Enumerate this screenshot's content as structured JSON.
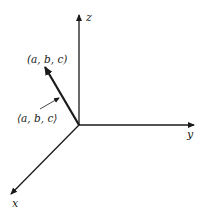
{
  "diagram": {
    "title": "",
    "axes": {
      "x": {
        "label": "x"
      },
      "y": {
        "label": "y"
      },
      "z": {
        "label": "z"
      }
    },
    "point_label": "(a, b, c)",
    "vector_label": "⟨a, b, c⟩",
    "colors": {
      "ink": "#1a1a1a",
      "background": "#ffffff"
    }
  }
}
